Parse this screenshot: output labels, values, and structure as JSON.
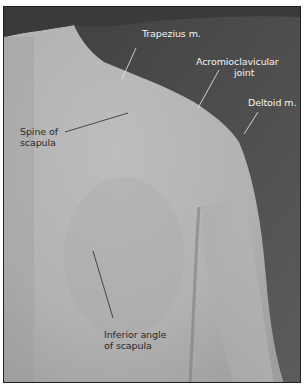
{
  "figure": {
    "colors": {
      "background_dark": "#4e4e4e",
      "skin_light": "#b9b9b9",
      "skin_mid": "#a8a8a8",
      "label_on_dark": "#f4f4f4",
      "label_on_light": "#2a2a2a"
    },
    "labels": [
      {
        "id": "trapezius",
        "text": "Trapezius m."
      },
      {
        "id": "acromioclavicular",
        "line1": "Acromioclavicular",
        "line2": "joint"
      },
      {
        "id": "deltoid",
        "text": "Deltoid m."
      },
      {
        "id": "spine-of-scapula",
        "line1": "Spine of",
        "line2": "scapula"
      },
      {
        "id": "inferior-angle",
        "line1": "Inferior angle",
        "line2": "of scapula"
      }
    ]
  }
}
